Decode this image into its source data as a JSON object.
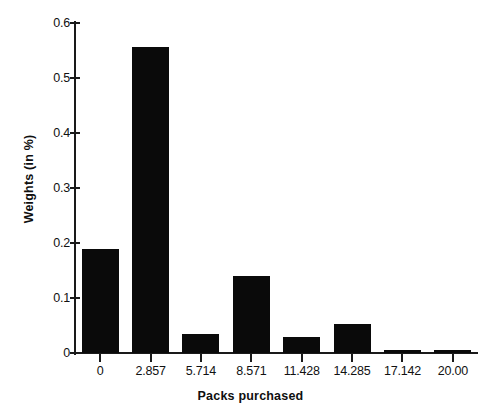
{
  "chart_data": {
    "type": "bar",
    "title": "",
    "xlabel": "Packs purchased",
    "ylabel": "Weights (in %)",
    "categories": [
      "0",
      "2.857",
      "5.714",
      "8.571",
      "11.428",
      "14.285",
      "17.142",
      "20.00"
    ],
    "values": [
      0.19,
      0.557,
      0.035,
      0.14,
      0.03,
      0.052,
      0.005,
      0.005
    ],
    "ylim": [
      0,
      0.6
    ],
    "y_ticks": [
      0,
      0.1,
      0.2,
      0.3,
      0.4,
      0.5,
      0.6
    ],
    "y_tick_labels": [
      "0",
      "0.1",
      "0.2",
      "0.3",
      "0.4",
      "0.5",
      "0.6"
    ],
    "x_tick_labels": [
      "0",
      "2.857",
      "5.714",
      "8.571",
      "11.428",
      "14.285",
      "17.142",
      "20.00"
    ],
    "grid": false,
    "legend": null,
    "bar_color": "#0a0a0a",
    "axis_color": "#1a1a1a",
    "background": "#ffffff"
  }
}
